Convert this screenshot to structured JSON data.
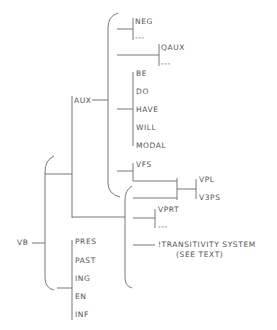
{
  "diagram": {
    "type": "tree",
    "root": "VB",
    "labels": {
      "vb": "VB",
      "aux": "AUX",
      "neg": "NEG",
      "neg_empty": "---",
      "qaux": "QAUX",
      "qaux_empty": "---",
      "be": "BE",
      "do": "DO",
      "have": "HAVE",
      "will": "WILL",
      "modal": "MODAL",
      "vfs": "VFS",
      "vpl": "VPL",
      "v3ps": "V3PS",
      "vprt": "VPRT",
      "vprt_empty": "---",
      "transitivity_line1": "!TRANSITIVITY SYSTEM",
      "transitivity_line2": "(SEE TEXT)",
      "pres": "PRES",
      "past": "PAST",
      "ing": "ING",
      "en": "EN",
      "inf": "INF"
    },
    "structure": {
      "VB": [
        {
          "AUX": [
            {
              "choice": [
                "NEG",
                "---"
              ]
            },
            {
              "choice": [
                "QAUX",
                "---"
              ]
            },
            {
              "choice": [
                "BE",
                "DO",
                "HAVE",
                "WILL",
                "MODAL"
              ]
            },
            {
              "VFS": [],
              "choice": [
                "VPL",
                "V3PS"
              ]
            }
          ]
        },
        {
          "simultaneous": [
            {
              "choice": [
                "VPL",
                "V3PS"
              ]
            },
            {
              "choice": [
                "VPRT",
                "---"
              ]
            },
            "!TRANSITIVITY SYSTEM (SEE TEXT)"
          ]
        },
        {
          "choice": [
            "PRES",
            "PAST",
            "ING",
            "EN",
            "INF"
          ]
        }
      ]
    }
  }
}
